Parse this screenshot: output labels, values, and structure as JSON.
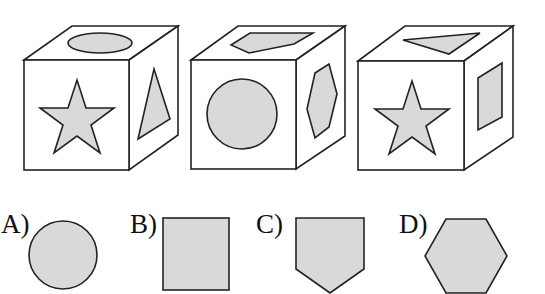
{
  "puzzle": {
    "cubes": [
      {
        "id": 1,
        "top": "ellipse",
        "front": "star",
        "right": "triangle"
      },
      {
        "id": 2,
        "top": "pentagon",
        "front": "circle",
        "right": "hexagon"
      },
      {
        "id": 3,
        "top": "triangle",
        "front": "star",
        "right": "rectangle"
      }
    ],
    "options": [
      {
        "label": "A)",
        "shape": "circle"
      },
      {
        "label": "B)",
        "shape": "square"
      },
      {
        "label": "C)",
        "shape": "pentagon"
      },
      {
        "label": "D)",
        "shape": "hexagon"
      }
    ]
  },
  "colors": {
    "fill": "#d9d9d9",
    "stroke": "#222222",
    "face": "#ffffff"
  }
}
